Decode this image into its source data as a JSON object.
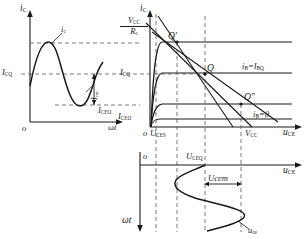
{
  "figure": {
    "axis_color": "#1a1a1a",
    "dash_color": "#555555"
  },
  "left_plot": {
    "name": "collector-current-waveform",
    "y_axis_label": "iC",
    "x_axis_label": "ωt",
    "origin_label": "o",
    "ticks": [
      {
        "id": "icq",
        "label": "ICQ"
      },
      {
        "id": "iceo",
        "label": "ICEO"
      }
    ],
    "annotations": [
      {
        "id": "ic-wave",
        "label": "ic"
      },
      {
        "id": "icm",
        "label": "Icm"
      }
    ]
  },
  "middle_plot": {
    "name": "output-characteristics-loadline",
    "y_axis_label": "iC",
    "x_axis_label": "uCE",
    "origin_label": "o",
    "y_max_label": {
      "numerator": "VCC",
      "denominator": "Rc"
    },
    "y_ticks": [
      {
        "id": "icq",
        "label": "ICQ"
      },
      {
        "id": "iceo",
        "label": "ICEO"
      }
    ],
    "x_ticks": [
      {
        "id": "uces",
        "label": "UCES"
      },
      {
        "id": "vcc",
        "label": "VCC"
      }
    ],
    "operating_points": [
      {
        "id": "q-prime",
        "label": "Q′"
      },
      {
        "id": "q",
        "label": "Q"
      },
      {
        "id": "q-double-prime",
        "label": "Q″"
      }
    ],
    "curve_labels": [
      {
        "id": "ib-ibq",
        "label": "iB=IBQ"
      },
      {
        "id": "ib-zero",
        "label": "iB=0"
      }
    ]
  },
  "bottom_plot": {
    "name": "collector-voltage-waveform",
    "y_axis_label": "ωt",
    "x_axis_label": "uCE",
    "origin_label": "o",
    "annotations": [
      {
        "id": "uceq",
        "label": "UCEQ"
      },
      {
        "id": "ucem",
        "label": "Ucem"
      },
      {
        "id": "uce-wave",
        "label": "uce"
      }
    ]
  },
  "chart_data": {
    "type": "line",
    "panels": [
      {
        "id": "left",
        "type": "line",
        "xlabel": "ωt",
        "ylabel": "iC",
        "description": "Collector current waveform ic riding on quiescent level ICQ, asymmetric sine with amplitude Icm",
        "series": [
          {
            "name": "ic",
            "x": [
              0,
              12,
              25,
              38,
              50,
              62,
              75,
              88,
              100
            ],
            "y": [
              35,
              62,
              72,
              62,
              35,
              12,
              2,
              14,
              30
            ]
          }
        ],
        "reference_levels": [
          {
            "name": "ICQ",
            "value": 35
          },
          {
            "name": "ICEO",
            "value": 2
          },
          {
            "name": "peak",
            "value": 72
          }
        ]
      },
      {
        "id": "middle",
        "type": "line",
        "xlabel": "uCE",
        "ylabel": "iC",
        "description": "Output characteristic curves with DC/AC load lines intersecting at Q, Q', Q''",
        "xlim": [
          0,
          100
        ],
        "ylim": [
          0,
          100
        ],
        "curves": [
          {
            "name": "iB=IBQ",
            "saturation_level": 62
          },
          {
            "name": "iB (mid)",
            "saturation_level": 40
          },
          {
            "name": "iB=0",
            "saturation_level": 12
          }
        ],
        "load_lines": [
          {
            "name": "dc-load-line",
            "x0": 6,
            "y0": 92,
            "x1": 88,
            "y1": 0
          },
          {
            "name": "ac-load-line-steep",
            "x0": 12,
            "y0": 100,
            "x1": 70,
            "y1": 0
          },
          {
            "name": "ac-load-line-shallow",
            "x0": 6,
            "y0": 78,
            "x1": 95,
            "y1": 6
          }
        ],
        "points": [
          {
            "name": "Q′",
            "x": 24,
            "y": 66
          },
          {
            "name": "Q",
            "x": 48,
            "y": 40
          },
          {
            "name": "Q″",
            "x": 70,
            "y": 18
          }
        ],
        "x_ticks": [
          {
            "label": "UCES",
            "value": 6
          },
          {
            "label": "VCC",
            "value": 88
          }
        ],
        "y_ticks": [
          {
            "label": "VCC/Rc",
            "value": 100
          },
          {
            "label": "ICQ",
            "value": 40
          },
          {
            "label": "ICEO",
            "value": 12
          }
        ]
      },
      {
        "id": "bottom",
        "type": "line",
        "xlabel": "uCE",
        "ylabel": "ωt",
        "description": "Collector-emitter voltage waveform uce about UCEQ with amplitude Ucem, plotted sideways",
        "series": [
          {
            "name": "uce",
            "t": [
              0,
              12,
              25,
              38,
              50,
              62,
              75,
              88,
              100
            ],
            "u": [
              48,
              22,
              12,
              22,
              48,
              70,
              78,
              68,
              52
            ]
          }
        ],
        "reference_levels": [
          {
            "name": "UCEQ",
            "value": 48
          },
          {
            "name": "Ucem",
            "value": 30
          }
        ]
      }
    ]
  }
}
